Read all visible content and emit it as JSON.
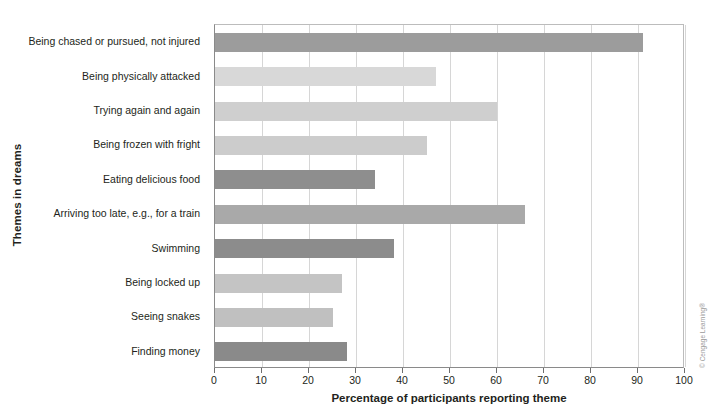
{
  "chart_data": {
    "type": "bar",
    "orientation": "horizontal",
    "title": "",
    "xlabel": "Percentage of participants reporting theme",
    "ylabel": "Themes in dreams",
    "xlim": [
      0,
      100
    ],
    "xticks": [
      0,
      10,
      20,
      30,
      40,
      50,
      60,
      70,
      80,
      90,
      100
    ],
    "grid": true,
    "legend": false,
    "categories": [
      "Being chased or pursued, not injured",
      "Being physically attacked",
      "Trying again and again",
      "Being frozen with fright",
      "Eating delicious food",
      "Arriving too late, e.g., for a train",
      "Swimming",
      "Being locked up",
      "Seeing snakes",
      "Finding money"
    ],
    "values": [
      91,
      47,
      60,
      45,
      34,
      66,
      38,
      27,
      25,
      28
    ],
    "bar_colors": [
      "#9c9c9c",
      "#d8d8d8",
      "#cfcfcf",
      "#cccccc",
      "#8e8e8e",
      "#a9a9a9",
      "#8c8c8c",
      "#c4c4c4",
      "#c0c0c0",
      "#8a8a8a"
    ]
  },
  "credit": {
    "text": "© Cengage Learning®"
  },
  "colors": {
    "axis": "#8a8a8a",
    "grid": "#d6d6d6",
    "text": "#231f20",
    "background": "#ffffff"
  }
}
